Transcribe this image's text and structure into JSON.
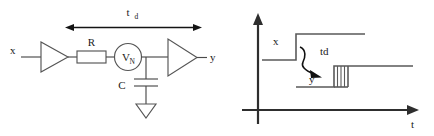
{
  "figure": {
    "colors": {
      "wire": "#4a4a4a",
      "shape": "#555555",
      "axis": "#2e2e2e",
      "dimension": "#141414",
      "waveform": "#5a5a5a",
      "text": "#1a1a1a",
      "background": "#ffffff"
    }
  },
  "circuit": {
    "delay_label": "t",
    "delay_label_sub": "d",
    "input_label": "x",
    "output_label": "y",
    "resistor_label": "R",
    "capacitor_label": "C",
    "noise_source_label": "V",
    "noise_source_sub": "N",
    "elements": [
      "input-buffer-triangle",
      "resistor",
      "noise-voltage-source",
      "capacitor",
      "ground",
      "output-buffer-triangle"
    ]
  },
  "timing": {
    "y_axis_label": "",
    "x_axis_label": "t",
    "input_wave_label": "x",
    "output_wave_label": "y",
    "delay_annotation": "td",
    "uncertainty_band_lines": 4
  }
}
